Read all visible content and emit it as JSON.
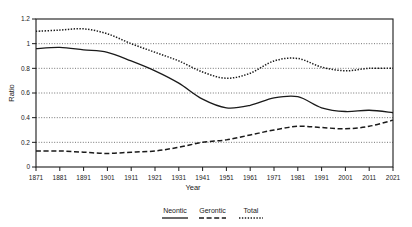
{
  "chart_data": {
    "type": "line",
    "title": "",
    "xlabel": "Year",
    "ylabel": "Ratio",
    "xlim": [
      1871,
      2021
    ],
    "ylim": [
      0,
      1.2
    ],
    "grid": true,
    "grid_style": "dotted-horizontal",
    "legend_position": "bottom-center",
    "ytick_labels": [
      "0",
      "0.2",
      "0.4",
      "0.6",
      "0.8",
      "1",
      "1.2"
    ],
    "ytick_values": [
      0,
      0.2,
      0.4,
      0.6,
      0.8,
      1.0,
      1.2
    ],
    "xtick_labels": [
      "1871",
      "1881",
      "1891",
      "1901",
      "1911",
      "1921",
      "1931",
      "1941",
      "1951",
      "1961",
      "1971",
      "1981",
      "1991",
      "2001",
      "2011",
      "2021"
    ],
    "x": [
      1871,
      1881,
      1891,
      1901,
      1911,
      1921,
      1931,
      1941,
      1951,
      1961,
      1971,
      1981,
      1991,
      2001,
      2011,
      2021
    ],
    "series": [
      {
        "name": "Neontic",
        "style": "solid",
        "color": "#1a1a1a",
        "values": [
          0.96,
          0.97,
          0.95,
          0.93,
          0.86,
          0.78,
          0.68,
          0.55,
          0.48,
          0.5,
          0.56,
          0.57,
          0.48,
          0.45,
          0.46,
          0.44
        ]
      },
      {
        "name": "Gerontic",
        "style": "dashed",
        "color": "#1a1a1a",
        "values": [
          0.13,
          0.13,
          0.12,
          0.11,
          0.12,
          0.13,
          0.16,
          0.2,
          0.22,
          0.26,
          0.3,
          0.33,
          0.32,
          0.31,
          0.33,
          0.38
        ]
      },
      {
        "name": "Total",
        "style": "dotted",
        "color": "#1a1a1a",
        "values": [
          1.1,
          1.11,
          1.12,
          1.08,
          1.0,
          0.93,
          0.86,
          0.77,
          0.72,
          0.76,
          0.86,
          0.88,
          0.81,
          0.78,
          0.8,
          0.8
        ]
      }
    ]
  },
  "legend": {
    "entries": [
      {
        "label": "Neontic",
        "style": "solid"
      },
      {
        "label": "Gerontic",
        "style": "dashed"
      },
      {
        "label": "Total",
        "style": "dotted"
      }
    ]
  },
  "axes": {
    "x_title": "Year",
    "y_title": "Ratio"
  }
}
